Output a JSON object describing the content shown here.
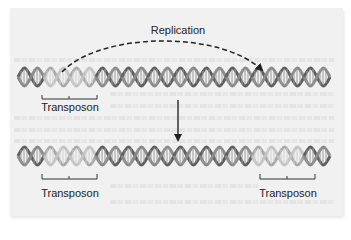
{
  "diagram": {
    "labels": {
      "replication": "Replication",
      "transposon_top": "Transposon",
      "transposon_bottom_left": "Transposon",
      "transposon_bottom_right": "Transposon"
    },
    "top_dna": {
      "description": "DNA double helix with one transposon segment (lighter color) near the left end",
      "transposon_segments": 1
    },
    "bottom_dna": {
      "description": "DNA double helix after replication with two transposon copies (left and right)",
      "transposon_segments": 2
    },
    "arrows": [
      {
        "name": "replication-arrow",
        "style": "dashed curved",
        "from": "top transposon",
        "to": "new insertion site"
      },
      {
        "name": "result-arrow",
        "style": "solid vertical",
        "from": "top DNA",
        "to": "bottom DNA"
      }
    ],
    "colors": {
      "dna_strand": "#6f6f6f",
      "transposon_strand": "#b4b4b4",
      "arrow": "#222222",
      "page_background": "#f1f1f1"
    }
  }
}
